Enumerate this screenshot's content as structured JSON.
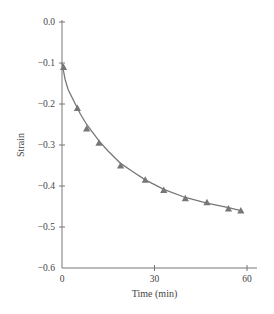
{
  "chart_data": {
    "type": "line",
    "title": "",
    "xlabel": "Time (min)",
    "ylabel": "Strain",
    "xlim": [
      0,
      60
    ],
    "ylim": [
      -0.6,
      0.0
    ],
    "x_ticks": [
      0,
      30,
      60
    ],
    "x_tick_labels": [
      "0",
      "30",
      "60"
    ],
    "y_ticks": [
      0.0,
      -0.1,
      -0.2,
      -0.3,
      -0.4,
      -0.5,
      -0.6
    ],
    "y_tick_labels": [
      "0.0",
      "−0.1",
      "−0.2",
      "−0.3",
      "−0.4",
      "−0.5",
      "−0.6"
    ],
    "grid": false,
    "legend": null,
    "series": [
      {
        "name": "Measured strain",
        "marker": "triangle",
        "style": "markers",
        "x": [
          0.5,
          5,
          8,
          12,
          19,
          27,
          33,
          40,
          47,
          54,
          58
        ],
        "y": [
          -0.11,
          -0.21,
          -0.26,
          -0.295,
          -0.35,
          -0.385,
          -0.41,
          -0.43,
          -0.44,
          -0.455,
          -0.46
        ]
      },
      {
        "name": "Fitted curve",
        "style": "line",
        "x": [
          0,
          1,
          2,
          4,
          6,
          8,
          10,
          12,
          15,
          19,
          23,
          27,
          33,
          40,
          47,
          54,
          58
        ],
        "y": [
          -0.1,
          -0.14,
          -0.165,
          -0.195,
          -0.225,
          -0.25,
          -0.27,
          -0.29,
          -0.315,
          -0.345,
          -0.365,
          -0.385,
          -0.408,
          -0.428,
          -0.442,
          -0.453,
          -0.46
        ]
      }
    ],
    "colors": {
      "axis": "#777777",
      "series": "#777777",
      "text": "#444444"
    }
  }
}
